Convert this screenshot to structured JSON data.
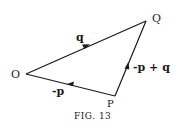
{
  "diagram": {
    "vertices": {
      "O": {
        "label": "O",
        "x": 26,
        "y": 74
      },
      "Q": {
        "label": "Q",
        "x": 146,
        "y": 21
      },
      "P": {
        "label": "P",
        "x": 115,
        "y": 96
      }
    },
    "edges": [
      {
        "from": "O",
        "to": "Q",
        "label": "q"
      },
      {
        "from": "P",
        "to": "Q",
        "label": "-p + q"
      },
      {
        "from": "P",
        "to": "O",
        "label": "-p"
      }
    ],
    "caption": "FIG. 13",
    "colors": {
      "line": "#1a1a1a",
      "background": "#ffffff"
    }
  }
}
